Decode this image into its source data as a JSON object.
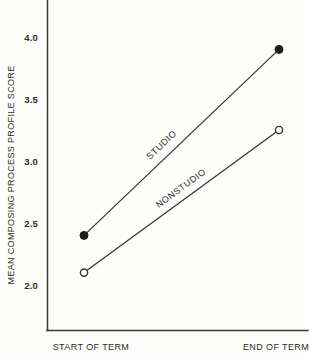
{
  "chart_data": {
    "type": "line",
    "title": "",
    "categories": [
      "START OF TERM",
      "END OF TERM"
    ],
    "series": [
      {
        "name": "STUDIO",
        "marker": "filled-circle",
        "values": [
          2.4,
          3.9
        ]
      },
      {
        "name": "NONSTUDIO",
        "marker": "open-circle",
        "values": [
          2.1,
          3.25
        ]
      }
    ],
    "xlabel": "",
    "ylabel": "MEAN COMPOSING PROCESS PROFILE SCORE",
    "yticks": [
      4.0,
      3.5,
      3.0,
      2.5,
      2.0
    ],
    "ytick_labels": [
      "4.0",
      "3.5",
      "3.0",
      "2.5",
      "2.0"
    ],
    "ylim": [
      1.6,
      4.3
    ],
    "grid": false,
    "legend_position": "inline-rotated-along-lines",
    "ink_color": "#2e2b28",
    "background_color": "#fdfdfb"
  }
}
